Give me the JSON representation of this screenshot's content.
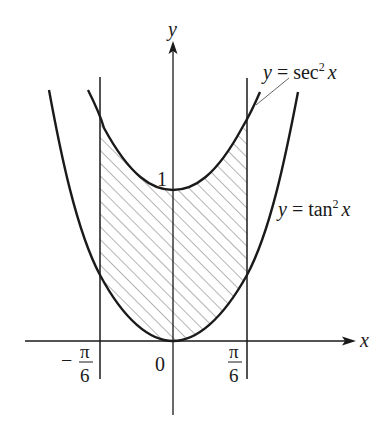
{
  "figure": {
    "type": "function-graph-shaded-region",
    "axes": {
      "x_label": "x",
      "y_label": "y"
    },
    "tick_labels": {
      "origin": "0",
      "y_one": "1",
      "left_bound_sign": "−",
      "left_bound_num": "π",
      "left_bound_den": "6",
      "right_bound_num": "π",
      "right_bound_den": "6"
    },
    "curves": [
      {
        "id": "sec2",
        "label_y": "y",
        "label_eq": "=",
        "label_fn": "sec",
        "label_exp": "2",
        "label_var": "x"
      },
      {
        "id": "tan2",
        "label_y": "y",
        "label_eq": "=",
        "label_fn": "tan",
        "label_exp": "2",
        "label_var": "x"
      }
    ],
    "region": {
      "description": "Hatched region between y = sec^2 x (top) and y = tan^2 x (bottom) from x = -pi/6 to x = pi/6",
      "x_from": "-π/6",
      "x_to": "π/6",
      "fill": "diagonal hatch"
    },
    "colors": {
      "ink": "#1a1a1a",
      "hatch": "#6a6a6a",
      "background": "#ffffff"
    }
  }
}
